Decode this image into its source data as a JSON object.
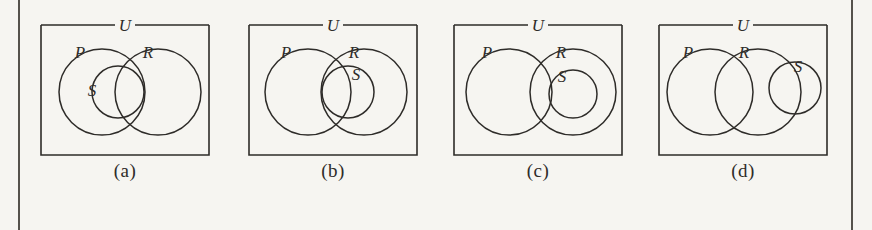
{
  "figure": {
    "type": "diagram",
    "colors": {
      "background": "#f6f5f1",
      "ink": "#2e2c29",
      "rule": "#55524c"
    },
    "page_rules": {
      "left_label": "left-margin-rule",
      "right_label": "right-margin-rule"
    }
  },
  "panels": [
    {
      "id": "a",
      "caption": "(a)",
      "universe_label": "U",
      "set_labels": {
        "p": "P",
        "r": "R",
        "s": "S"
      },
      "relation": "P and R overlap; S lies inside P and crosses into the P-and-R overlap region",
      "circles": [
        {
          "name": "P",
          "cx": 72,
          "cy": 92,
          "r": 43
        },
        {
          "name": "R",
          "cx": 128,
          "cy": 92,
          "r": 43
        },
        {
          "name": "S",
          "cx": 88,
          "cy": 92,
          "r": 26
        }
      ],
      "label_positions": {
        "p": {
          "x": 50,
          "y": 58
        },
        "r": {
          "x": 118,
          "y": 58
        },
        "s": {
          "x": 62,
          "y": 96
        },
        "u": {
          "x": 95,
          "y": 25
        }
      }
    },
    {
      "id": "b",
      "caption": "(b)",
      "universe_label": "U",
      "set_labels": {
        "p": "P",
        "r": "R",
        "s": "S"
      },
      "relation": "P and R overlap; S lies inside R and crosses into the P-and-R overlap region",
      "circles": [
        {
          "name": "P",
          "cx": 70,
          "cy": 92,
          "r": 43
        },
        {
          "name": "R",
          "cx": 126,
          "cy": 92,
          "r": 43
        },
        {
          "name": "S",
          "cx": 110,
          "cy": 92,
          "r": 26
        }
      ],
      "label_positions": {
        "p": {
          "x": 48,
          "y": 58
        },
        "r": {
          "x": 116,
          "y": 58
        },
        "s": {
          "x": 118,
          "y": 80
        },
        "u": {
          "x": 95,
          "y": 25
        }
      }
    },
    {
      "id": "c",
      "caption": "(c)",
      "universe_label": "U",
      "set_labels": {
        "p": "P",
        "r": "R",
        "s": "S"
      },
      "relation": "P and R overlap slightly; S lies entirely inside R",
      "circles": [
        {
          "name": "P",
          "cx": 66,
          "cy": 92,
          "r": 43
        },
        {
          "name": "R",
          "cx": 130,
          "cy": 92,
          "r": 43
        },
        {
          "name": "S",
          "cx": 130,
          "cy": 94,
          "r": 24
        }
      ],
      "label_positions": {
        "p": {
          "x": 44,
          "y": 58
        },
        "r": {
          "x": 118,
          "y": 58
        },
        "s": {
          "x": 119,
          "y": 82
        },
        "u": {
          "x": 95,
          "y": 25
        }
      }
    },
    {
      "id": "d",
      "caption": "(d)",
      "universe_label": "U",
      "set_labels": {
        "p": "P",
        "r": "R",
        "s": "S"
      },
      "relation": "P and R overlap strongly; S is a smaller circle overlapping the right edge of R only",
      "circles": [
        {
          "name": "P",
          "cx": 62,
          "cy": 92,
          "r": 43
        },
        {
          "name": "R",
          "cx": 110,
          "cy": 92,
          "r": 43
        },
        {
          "name": "S",
          "cx": 147,
          "cy": 88,
          "r": 26
        }
      ],
      "label_positions": {
        "p": {
          "x": 40,
          "y": 58
        },
        "r": {
          "x": 96,
          "y": 58
        },
        "s": {
          "x": 150,
          "y": 72
        },
        "u": {
          "x": 95,
          "y": 25
        }
      }
    }
  ]
}
